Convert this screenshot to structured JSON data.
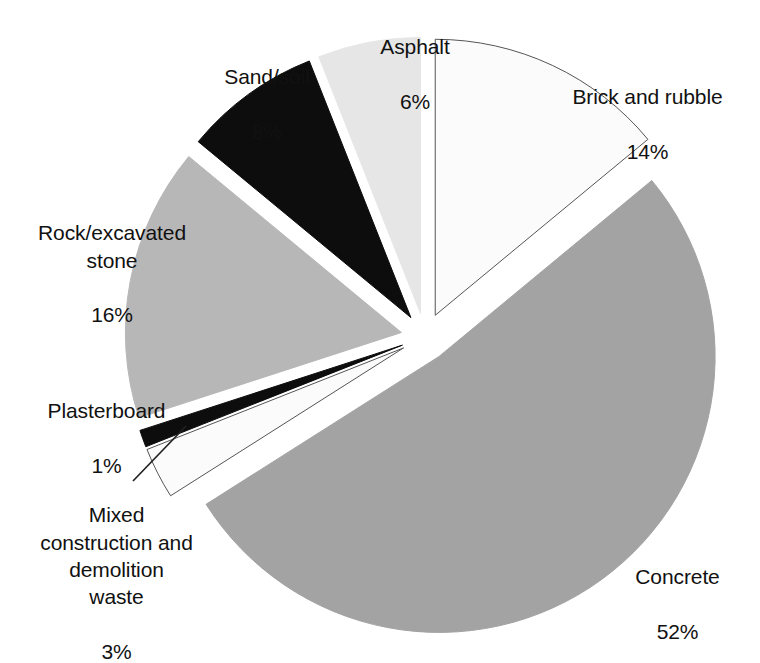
{
  "chart_data": {
    "type": "pie",
    "title": "",
    "subtitle": "",
    "xlabel": "",
    "ylabel": "",
    "units": "percent",
    "total": 100,
    "legend_position": "none",
    "labels_outside": true,
    "grid": false,
    "exploded": true,
    "categories": [
      "Brick and rubble",
      "Concrete",
      "Mixed construction and demolition waste",
      "Plasterboard",
      "Rock/excavated stone",
      "Sand/soil",
      "Asphalt"
    ],
    "values": [
      14,
      52,
      3,
      1,
      16,
      8,
      6
    ],
    "value_labels": [
      "14%",
      "52%",
      "3%",
      "1%",
      "16%",
      "8%",
      "6%"
    ],
    "colors": [
      "#fbfbfb",
      "#a3a3a3",
      "#fbfbfb",
      "#0d0d0d",
      "#b7b7b7",
      "#0d0d0d",
      "#e6e6e6"
    ],
    "slices": [
      {
        "name": "Brick and rubble",
        "label": "Brick and rubble",
        "value": 14,
        "value_label": "14%",
        "fill": "#fbfbfb",
        "stroke": "#555555"
      },
      {
        "name": "Concrete",
        "label": "Concrete",
        "value": 52,
        "value_label": "52%",
        "fill": "#a3a3a3",
        "stroke": "#a3a3a3"
      },
      {
        "name": "Mixed construction and demolition waste",
        "label": "Mixed\nconstruction and\ndemolition\nwaste",
        "value": 3,
        "value_label": "3%",
        "fill": "#fbfbfb",
        "stroke": "#555555"
      },
      {
        "name": "Plasterboard",
        "label": "Plasterboard",
        "value": 1,
        "value_label": "1%",
        "fill": "#0d0d0d",
        "stroke": "#0d0d0d"
      },
      {
        "name": "Rock/excavated stone",
        "label": "Rock/excavated\nstone",
        "value": 16,
        "value_label": "16%",
        "fill": "#b7b7b7",
        "stroke": "#b7b7b7"
      },
      {
        "name": "Sand/soil",
        "label": "Sand/soil",
        "value": 8,
        "value_label": "8%",
        "fill": "#0d0d0d",
        "stroke": "#0d0d0d"
      },
      {
        "name": "Asphalt",
        "label": "Asphalt",
        "value": 6,
        "value_label": "6%",
        "fill": "#e6e6e6",
        "stroke": "#e6e6e6"
      }
    ]
  },
  "labels": {
    "asphalt": {
      "name": "Asphalt",
      "value": "6%"
    },
    "sand_soil": {
      "name": "Sand/soil",
      "value": "8%"
    },
    "brick_rubble": {
      "name": "Brick and rubble",
      "value": "14%"
    },
    "rock_stone": {
      "name": "Rock/excavated\nstone",
      "value": "16%"
    },
    "plasterboard": {
      "name": "Plasterboard",
      "value": "1%"
    },
    "mixed_cdw": {
      "name": "Mixed\nconstruction and\ndemolition\nwaste",
      "value": "3%"
    },
    "concrete": {
      "name": "Concrete",
      "value": "52%"
    }
  },
  "style": {
    "background": "#ffffff",
    "text_color": "#111111",
    "leader_line_color": "#222222"
  }
}
